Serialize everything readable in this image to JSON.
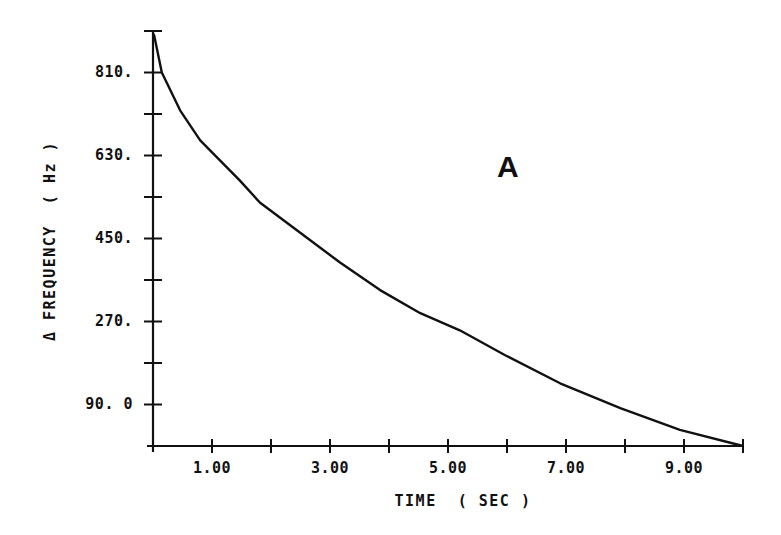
{
  "chart_data": {
    "type": "line",
    "title": "",
    "panel_label": "A",
    "xlabel": "TIME  ( SEC )",
    "ylabel": "Δ FREQUENCY  ( Hz )",
    "xlim": [
      0,
      10
    ],
    "ylim": [
      0,
      900
    ],
    "grid": false,
    "legend": null,
    "x_ticks": [
      0,
      1,
      2,
      3,
      4,
      5,
      6,
      7,
      8,
      9,
      10
    ],
    "x_tick_labels": [
      {
        "value": 1,
        "label": "1.00"
      },
      {
        "value": 3,
        "label": "3.00"
      },
      {
        "value": 5,
        "label": "5.00"
      },
      {
        "value": 7,
        "label": "7.00"
      },
      {
        "value": 9,
        "label": "9.00"
      }
    ],
    "y_ticks": [
      0,
      90,
      180,
      270,
      360,
      450,
      540,
      630,
      720,
      810,
      900
    ],
    "y_tick_labels": [
      {
        "value": 90,
        "label": "90. 0"
      },
      {
        "value": 270,
        "label": "270."
      },
      {
        "value": 450,
        "label": "450."
      },
      {
        "value": 630,
        "label": "630."
      },
      {
        "value": 810,
        "label": "810."
      }
    ],
    "series": [
      {
        "name": "frequency_shift",
        "color": "#111111",
        "x": [
          0.0,
          0.02,
          0.15,
          0.46,
          0.8,
          1.47,
          1.81,
          2.49,
          3.17,
          3.85,
          4.53,
          5.2,
          5.97,
          6.9,
          7.92,
          8.93,
          10.0
        ],
        "y": [
          895,
          890,
          810,
          728,
          663,
          576,
          528,
          463,
          398,
          338,
          288,
          251,
          197,
          136,
          82,
          35,
          0
        ]
      }
    ]
  }
}
